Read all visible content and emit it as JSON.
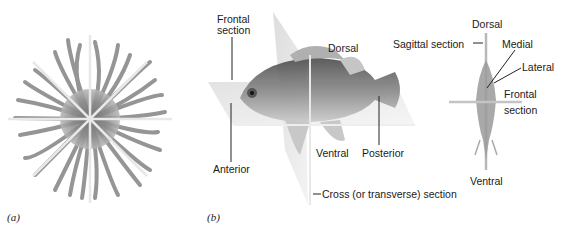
{
  "figure_a": {
    "caption": "(a)",
    "subject": "radially symmetric organism with tentacles",
    "planes": 4
  },
  "figure_b": {
    "caption": "(b)",
    "lateral_view": {
      "labels": {
        "frontal_section": [
          "Frontal",
          "section"
        ],
        "dorsal": "Dorsal",
        "ventral": "Ventral",
        "anterior": "Anterior",
        "posterior": "Posterior",
        "cross_section": "Cross (or transverse) section"
      }
    },
    "front_view": {
      "labels": {
        "dorsal": "Dorsal",
        "sagittal_section": "Sagittal section",
        "medial": "Medial",
        "lateral": "Lateral",
        "frontal_section": [
          "Frontal",
          "section"
        ],
        "ventral": "Ventral"
      }
    }
  },
  "colors": {
    "organism": "#8a8a8a",
    "plane": "#e6e6e6",
    "line": "#222222"
  }
}
